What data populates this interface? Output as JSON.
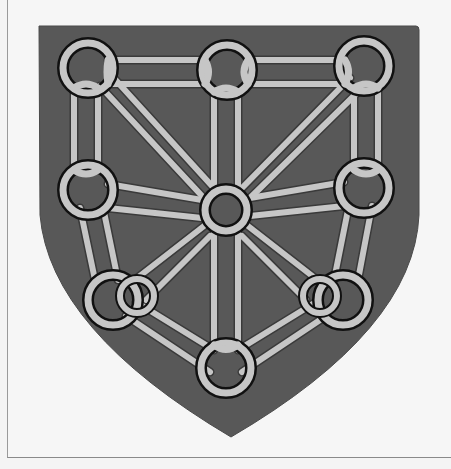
{
  "image": {
    "title": "Coat of arms: chains of Navarre",
    "description": "Grayscale heraldic shield with interlinked chain rings",
    "colors": {
      "background": "#f4f4f4",
      "frame_border": "#9a9a9a",
      "shield_fill": "#585858",
      "chain_fill": "#c6c6c6",
      "chain_outline": "#111111"
    },
    "rings": [
      {
        "name": "top-left",
        "cx": 88,
        "cy": 68
      },
      {
        "name": "top-center",
        "cx": 227,
        "cy": 70
      },
      {
        "name": "top-right",
        "cx": 364,
        "cy": 66
      },
      {
        "name": "middle-left",
        "cx": 88,
        "cy": 190
      },
      {
        "name": "center",
        "cx": 226,
        "cy": 210
      },
      {
        "name": "middle-right",
        "cx": 364,
        "cy": 188
      },
      {
        "name": "bottom-left",
        "cx": 113,
        "cy": 300
      },
      {
        "name": "bottom-right",
        "cx": 343,
        "cy": 300
      },
      {
        "name": "bottom-center",
        "cx": 226,
        "cy": 368
      }
    ]
  }
}
